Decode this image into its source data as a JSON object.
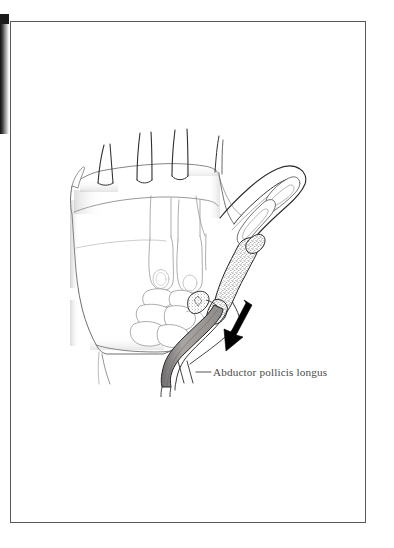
{
  "figure": {
    "kind": "anatomical-line-drawing",
    "medium": "pencil and ink illustration on white page",
    "page": {
      "background_color": "#ffffff",
      "border_color": "#58595b",
      "border_width_px": 1,
      "frame": {
        "x": 10,
        "y": 21,
        "width": 356,
        "height": 502
      }
    },
    "scan_artifact": {
      "name": "left-edge-scan-shadow",
      "color_dark": "#111111",
      "color_light": "#ffffff"
    }
  },
  "labels": [
    {
      "id": "abductor-pollicis-longus",
      "text": "Abductor pollicis longus",
      "color": "#4a4a4a",
      "font_style": "serif",
      "font_size_px": 11.2,
      "x": 213,
      "y": 367,
      "leader_line": {
        "from_x": 196,
        "from_y": 372,
        "to_x": 211,
        "to_y": 372,
        "color": "#4a4a4a"
      },
      "tick_marks": [
        {
          "x1": 178,
          "y1": 362,
          "x2": 184,
          "y2": 382
        },
        {
          "x1": 186,
          "y1": 362,
          "x2": 192,
          "y2": 382
        }
      ]
    }
  ],
  "annotations": [
    {
      "id": "traction-arrow",
      "name": "arrow",
      "description": "solid black arrow indicating direction of pull of the tendon",
      "color": "#000000",
      "tail_x": 243,
      "tail_y": 303,
      "tip_x": 228,
      "tip_y": 340,
      "direction": "down-left"
    }
  ],
  "structures": [
    {
      "id": "palm-soft-tissue",
      "name": "palm and wrist soft tissue outline",
      "stroke": "#6e6e70",
      "fill": "#ffffff"
    },
    {
      "id": "finger-stubs",
      "name": "amputated finger stubs",
      "count": 4,
      "stroke": "#3a3a3a"
    },
    {
      "id": "metacarpals-2-5",
      "name": "metacarpal shafts of fingers",
      "count": 3,
      "stroke": "#8a8a8c"
    },
    {
      "id": "carpal-bones",
      "name": "carpal bones",
      "count": 6,
      "stroke": "#8a8a8c"
    },
    {
      "id": "thumb-metacarpal",
      "name": "first metacarpal (stippled cancellous bone)",
      "stroke": "#2a2a2a",
      "texture": "stipple"
    },
    {
      "id": "thumb-proximal-phalanx",
      "name": "proximal phalanx of thumb",
      "stroke": "#4a4a4a"
    },
    {
      "id": "thumb-distal-phalanx",
      "name": "distal phalanx of thumb",
      "stroke": "#4a4a4a"
    },
    {
      "id": "thumb-soft-tissue",
      "name": "thumb soft tissue outline",
      "stroke": "#2a2a2a"
    },
    {
      "id": "apl-tendon",
      "name": "abductor pollicis longus tendon band",
      "stroke": "#2a2a2a",
      "fill": "#9d9a98"
    },
    {
      "id": "trapezium-fragment",
      "name": "bone fragment at tendon insertion",
      "stroke": "#2a2a2a",
      "texture": "stipple"
    }
  ]
}
